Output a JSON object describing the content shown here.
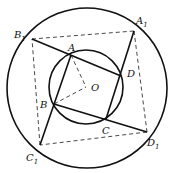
{
  "diagram": {
    "title": "",
    "outer_circle": {
      "cx": 87,
      "cy": 88,
      "r": 80
    },
    "inner_circle": {
      "cx": 86,
      "cy": 87,
      "r": 37
    },
    "points": {
      "A": {
        "x": 71,
        "y": 55
      },
      "B": {
        "x": 54,
        "y": 104
      },
      "C": {
        "x": 106,
        "y": 119
      },
      "D": {
        "x": 121,
        "y": 76
      },
      "O": {
        "x": 86,
        "y": 87
      },
      "A1": {
        "x": 134,
        "y": 31
      },
      "B1": {
        "x": 32,
        "y": 39
      },
      "C1": {
        "x": 40,
        "y": 145
      },
      "D1": {
        "x": 147,
        "y": 132
      }
    },
    "labels": {
      "A": "A",
      "B": "B",
      "C": "C",
      "D": "D",
      "O": "O",
      "A1_main": "A",
      "A1_sub": "1",
      "B1_main": "B",
      "B1_sub": "1",
      "C1_main": "C",
      "C1_sub": "1",
      "D1_main": "D",
      "D1_sub": "1"
    },
    "solid_lines": [
      [
        "B1",
        "D"
      ],
      [
        "A1",
        "C"
      ],
      [
        "D1",
        "B"
      ],
      [
        "C1",
        "A"
      ]
    ],
    "dashed_lines": [
      [
        "B1",
        "A1"
      ],
      [
        "A1",
        "D1"
      ],
      [
        "D1",
        "C1"
      ],
      [
        "C1",
        "B1"
      ],
      [
        "A",
        "O"
      ],
      [
        "B",
        "O"
      ]
    ],
    "colors": {
      "stroke": "#111111",
      "dashed": "#333333"
    }
  }
}
